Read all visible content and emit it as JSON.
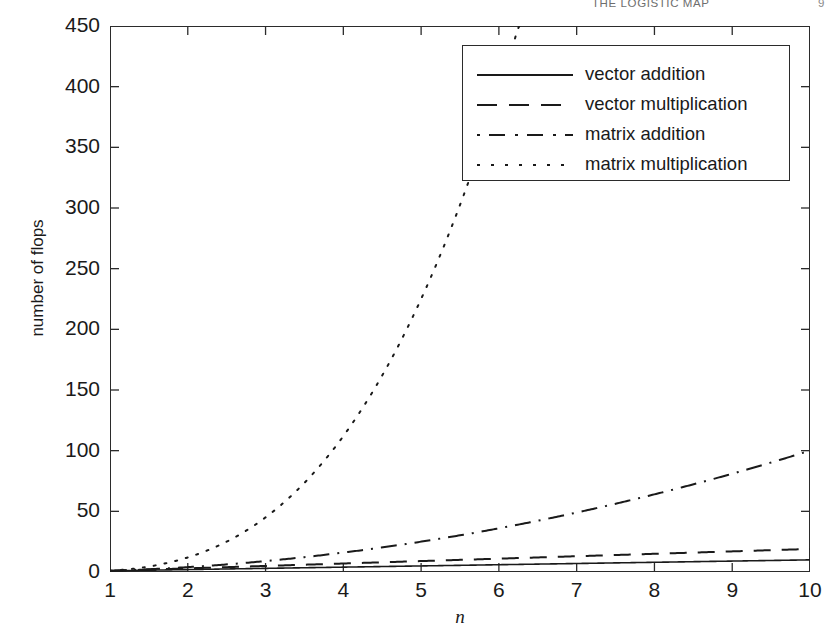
{
  "header": {
    "title": "THE LOGISTIC MAP",
    "folio": "9"
  },
  "chart_data": {
    "type": "line",
    "title": "",
    "xlabel": "n",
    "ylabel": "number of flops",
    "xlim": [
      1,
      10
    ],
    "ylim": [
      0,
      450
    ],
    "grid": false,
    "legend_position": "top-right",
    "xticks": [
      "1",
      "2",
      "3",
      "4",
      "5",
      "6",
      "7",
      "8",
      "9",
      "10"
    ],
    "yticks": [
      "0",
      "50",
      "100",
      "150",
      "200",
      "250",
      "300",
      "350",
      "400",
      "450"
    ],
    "x": [
      1,
      1.5,
      2,
      2.5,
      3,
      3.5,
      4,
      4.5,
      5,
      5.5,
      6,
      6.5,
      7,
      7.5,
      8,
      8.5,
      9,
      9.5,
      10
    ],
    "series": [
      {
        "name": "vector addition",
        "style": "solid",
        "formula": "n",
        "values": [
          1,
          1.5,
          2,
          2.5,
          3,
          3.5,
          4,
          4.5,
          5,
          5.5,
          6,
          6.5,
          7,
          7.5,
          8,
          8.5,
          9,
          9.5,
          10
        ]
      },
      {
        "name": "vector multiplication",
        "style": "dashed",
        "formula": "2n - 1",
        "values": [
          1,
          2,
          3,
          4,
          5,
          6,
          7,
          8,
          9,
          10,
          11,
          12,
          13,
          14,
          15,
          16,
          17,
          18,
          19
        ]
      },
      {
        "name": "matrix addition",
        "style": "dash-dot",
        "formula": "n^2",
        "values": [
          1,
          2.25,
          4,
          6.25,
          9,
          12.25,
          16,
          20.25,
          25,
          30.25,
          36,
          42.25,
          49,
          56.25,
          64,
          72.25,
          81,
          90.25,
          100
        ]
      },
      {
        "name": "matrix multiplication",
        "style": "dotted",
        "formula": "2n^3 - n^2",
        "values": [
          1,
          4.5,
          12,
          25,
          45,
          73.5,
          112,
          162,
          225,
          302.5,
          396,
          507,
          637,
          787.5,
          960,
          1156.5,
          1377,
          1624.5,
          1900
        ]
      }
    ]
  },
  "axes": {
    "y_label_text": "number of flops",
    "x_label_text": "n"
  }
}
